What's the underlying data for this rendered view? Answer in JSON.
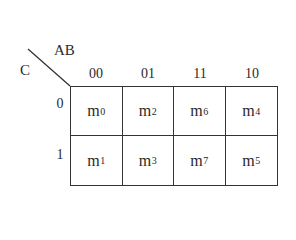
{
  "kmap": {
    "row_variable": "C",
    "column_variable": "AB",
    "column_headers": [
      "00",
      "01",
      "11",
      "10"
    ],
    "row_headers": [
      "0",
      "1"
    ],
    "cells": [
      [
        {
          "base": "m",
          "sub": "0"
        },
        {
          "base": "m",
          "sub": "2"
        },
        {
          "base": "m",
          "sub": "6"
        },
        {
          "base": "m",
          "sub": "4"
        }
      ],
      [
        {
          "base": "m",
          "sub": "1"
        },
        {
          "base": "m",
          "sub": "3"
        },
        {
          "base": "m",
          "sub": "7"
        },
        {
          "base": "m",
          "sub": "5"
        }
      ]
    ]
  },
  "colors": {
    "line": "#333333",
    "text": "#2a2a2a",
    "background": "#ffffff"
  }
}
